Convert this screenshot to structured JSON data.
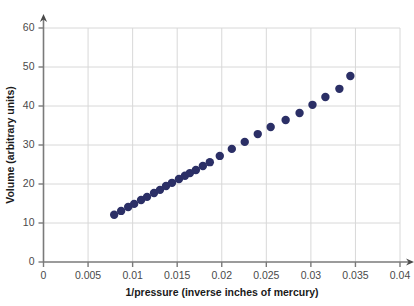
{
  "chart_data": {
    "type": "scatter",
    "title": "",
    "xlabel": "1/pressure (inverse inches of mercury)",
    "ylabel": "Volume (arbitrary units)",
    "xlim": [
      0,
      0.04
    ],
    "ylim": [
      0,
      60
    ],
    "xticks": [
      0,
      0.005,
      0.01,
      0.015,
      0.02,
      0.025,
      0.03,
      0.035,
      0.04
    ],
    "xticklabels": [
      "0",
      "0.005",
      "0.01",
      "0.015",
      "0.02",
      "0.025",
      "0.03",
      "0.035",
      "0.04"
    ],
    "yticks": [
      0,
      10,
      20,
      30,
      40,
      50,
      60
    ],
    "yticklabels": [
      "0",
      "10",
      "20",
      "30",
      "40",
      "50",
      "60"
    ],
    "grid": true,
    "grid_axes": "both",
    "legend": null,
    "marker_color": "#2b2f66",
    "marker_size": 4.2,
    "series": [
      {
        "name": "volume vs 1/pressure",
        "x": [
          0.00793,
          0.00871,
          0.0095,
          0.01017,
          0.01095,
          0.01162,
          0.0124,
          0.01307,
          0.01375,
          0.01442,
          0.0152,
          0.01587,
          0.01643,
          0.0171,
          0.01788,
          0.01866,
          0.01978,
          0.02113,
          0.02258,
          0.02404,
          0.02549,
          0.02717,
          0.02873,
          0.03018,
          0.03163,
          0.0332,
          0.03443
        ],
        "y": [
          12.1,
          13.1,
          14.1,
          14.9,
          15.9,
          16.7,
          17.7,
          18.5,
          19.5,
          20.3,
          21.3,
          22.1,
          22.8,
          23.6,
          24.6,
          25.6,
          27.2,
          29.0,
          30.8,
          32.8,
          34.6,
          36.4,
          38.2,
          40.3,
          42.3,
          44.4,
          47.7
        ]
      }
    ],
    "point_count": 27
  },
  "geometry": {
    "plot_left": 43.5,
    "plot_right": 400,
    "plot_top": 28,
    "plot_bottom": 262,
    "x_min": 0,
    "x_max": 0.04,
    "y_min": 0,
    "y_max": 60,
    "ylabel_x": 14,
    "ylabel_y": 145,
    "xlabel_x": 222,
    "xlabel_y": 296
  }
}
